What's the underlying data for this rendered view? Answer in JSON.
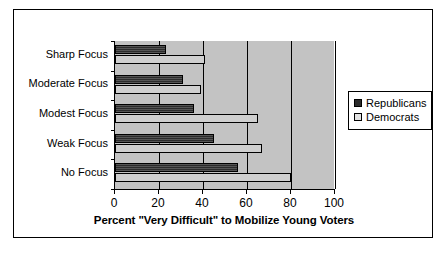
{
  "chart_data": {
    "type": "bar",
    "orientation": "horizontal",
    "title": "",
    "xlabel": "Percent \"Very Difficult\" to Mobilize Young Voters",
    "ylabel": "",
    "categories": [
      "Sharp Focus",
      "Moderate Focus",
      "Modest Focus",
      "Weak Focus",
      "No Focus"
    ],
    "series": [
      {
        "name": "Republicans",
        "color": "#2b2b2b",
        "values": [
          23,
          31,
          36,
          45,
          56
        ]
      },
      {
        "name": "Democrats",
        "color": "#cfcfcf",
        "values": [
          41,
          39,
          65,
          67,
          80
        ]
      }
    ],
    "xlim": [
      0,
      100
    ],
    "xticks": [
      0,
      20,
      40,
      60,
      80,
      100
    ],
    "xtick_labels": [
      "0",
      "20",
      "40",
      "60",
      "80",
      "100"
    ],
    "grid": true,
    "grid_axis": "x",
    "legend_position": "right",
    "plot_background": "#c3c3c3",
    "frame": true
  },
  "legend": {
    "items": [
      {
        "label": "Republicans",
        "key": "legend-swatch-republicans"
      },
      {
        "label": "Democrats",
        "key": "legend-swatch-democrats"
      }
    ]
  }
}
